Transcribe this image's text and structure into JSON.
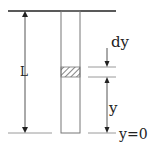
{
  "diagram": {
    "labels": {
      "length": "L",
      "element_thickness": "dy",
      "height": "y",
      "origin": "y=0"
    },
    "colors": {
      "stroke": "#222222",
      "light_stroke": "#9a9a9a",
      "background": "#ffffff"
    }
  }
}
